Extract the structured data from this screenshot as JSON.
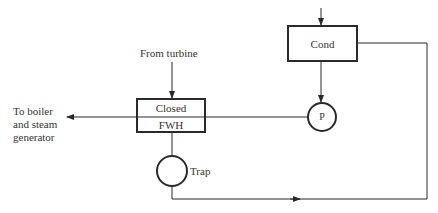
{
  "diagram": {
    "labels": {
      "from_turbine": "From turbine",
      "to_boiler_line1": "To boiler",
      "to_boiler_line2": "and steam",
      "to_boiler_line3": "generator",
      "closed": "Closed",
      "fwh": "FWH",
      "cond": "Cond",
      "pump": "P",
      "trap": "Trap"
    },
    "colors": {
      "line": "#2a2a2a",
      "text": "#333333",
      "background": "#ffffff"
    }
  }
}
